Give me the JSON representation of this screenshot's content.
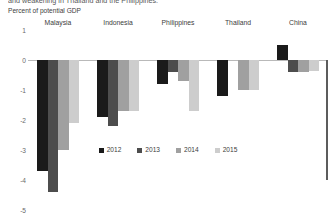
{
  "header": {
    "cut_title": "and weakening in Thailand and the Philippines.",
    "subtitle": "Percent of potential GDP"
  },
  "chart_data": {
    "type": "bar",
    "title": "",
    "subtitle": "Percent of potential GDP",
    "xlabel": "",
    "ylabel": "Percent of potential GDP",
    "categories": [
      "Malaysia",
      "Indonesia",
      "Philippines",
      "Thailand",
      "China"
    ],
    "series": [
      {
        "name": "2012",
        "color": "#1a1a1a",
        "values": [
          -3.7,
          -1.9,
          -0.8,
          -1.2,
          0.5
        ]
      },
      {
        "name": "2013",
        "color": "#4d4d4d",
        "values": [
          -4.4,
          -2.2,
          -0.4,
          0.0,
          -0.4
        ]
      },
      {
        "name": "2014",
        "color": "#a0a0a0",
        "values": [
          -3.0,
          -1.7,
          -0.7,
          -1.0,
          -0.4
        ]
      },
      {
        "name": "2015",
        "color": "#cdcdcd",
        "values": [
          -2.1,
          -1.7,
          -1.7,
          -1.0,
          -0.35
        ]
      }
    ],
    "ylim": [
      -5,
      1
    ],
    "yticks": [
      "1",
      "0",
      "-1",
      "-2",
      "-3",
      "-4",
      "-5"
    ],
    "ytick_values": [
      1,
      0,
      -1,
      -2,
      -3,
      -4,
      -5
    ],
    "grid": false,
    "legend_position": "bottom-center",
    "legend": [
      "2012",
      "2013",
      "2014",
      "2015"
    ]
  },
  "colors": {
    "zero_line": "#b9b9b9",
    "axis": "#5c5c5c",
    "text": "#3d3d3d",
    "tick_text": "#6a6a6a",
    "background": "#ffffff"
  }
}
